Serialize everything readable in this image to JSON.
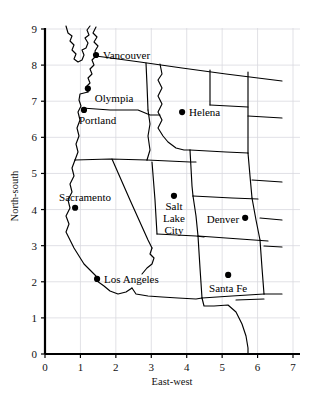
{
  "chart_data": {
    "type": "scatter",
    "title": "",
    "xlabel": "East-west",
    "ylabel": "North-south",
    "xlim": [
      0,
      7
    ],
    "ylim": [
      0,
      9
    ],
    "xticks": [
      "0",
      "1",
      "2",
      "3",
      "4",
      "5",
      "6",
      "7"
    ],
    "yticks": [
      "0",
      "1",
      "2",
      "3",
      "4",
      "5",
      "6",
      "7",
      "8",
      "9"
    ],
    "grid": true,
    "grid_color": "#d9d9e0",
    "axis_color": "#000000",
    "marker_color": "#000000",
    "legend": "none",
    "points": [
      {
        "name": "Vancouver",
        "x": 1.44,
        "y": 8.28,
        "label_dx": 7,
        "label_dy": 4,
        "anchor": "start"
      },
      {
        "name": "Olympia",
        "x": 1.21,
        "y": 7.35,
        "label_dx": 7,
        "label_dy": 13,
        "anchor": "start"
      },
      {
        "name": "Portland",
        "x": 1.1,
        "y": 6.76,
        "label_dx": -5,
        "label_dy": 14,
        "anchor": "start"
      },
      {
        "name": "Helena",
        "x": 3.87,
        "y": 6.7,
        "label_dx": 7,
        "label_dy": 4,
        "anchor": "start"
      },
      {
        "name": "Sacramento",
        "x": 0.85,
        "y": 4.05,
        "label_dx": -16,
        "label_dy": -7,
        "anchor": "start"
      },
      {
        "name": "Salt Lake City",
        "x": 3.64,
        "y": 4.38,
        "label_dx": 0,
        "label_dy": 0,
        "anchor": "middle",
        "multiline": [
          "Salt",
          "Lake",
          "City"
        ]
      },
      {
        "name": "Denver",
        "x": 5.65,
        "y": 3.77,
        "label_dx": -6,
        "label_dy": 5,
        "anchor": "end"
      },
      {
        "name": "Los Angeles",
        "x": 1.47,
        "y": 2.08,
        "label_dx": 7,
        "label_dy": 4,
        "anchor": "start"
      },
      {
        "name": "Santa Fe",
        "x": 5.17,
        "y": 2.19,
        "label_dx": 0,
        "label_dy": 17,
        "anchor": "middle"
      }
    ]
  },
  "axes": {
    "x_title": "East-west",
    "y_title": "North-south",
    "x_tick_labels": [
      "0",
      "1",
      "2",
      "3",
      "4",
      "5",
      "6",
      "7"
    ],
    "y_tick_labels": [
      "0",
      "1",
      "2",
      "3",
      "4",
      "5",
      "6",
      "7",
      "8",
      "9"
    ]
  },
  "cities": {
    "vancouver": "Vancouver",
    "olympia": "Olympia",
    "portland": "Portland",
    "helena": "Helena",
    "sacramento": "Sacramento",
    "salt_lake_city_1": "Salt",
    "salt_lake_city_2": "Lake",
    "salt_lake_city_3": "City",
    "denver": "Denver",
    "los_angeles": "Los Angeles",
    "santa_fe": "Santa Fe"
  },
  "colors": {
    "background": "#ffffff",
    "grid": "#d9d9e0",
    "axis": "#000000",
    "outline": "#000000",
    "marker": "#000000",
    "text": "#111111"
  }
}
